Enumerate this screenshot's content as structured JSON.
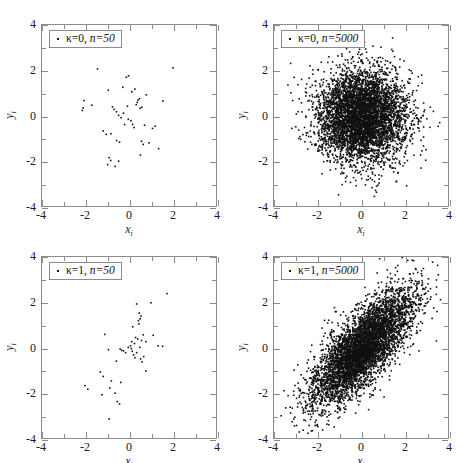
{
  "figure": {
    "background": "#ffffff",
    "point_color": "#111111",
    "axis_color": "#8c8c8c",
    "rows": 2,
    "cols": 2
  },
  "axes": {
    "xlabel": "x",
    "xlabel_sub": "i",
    "ylabel": "y",
    "ylabel_sub": "i",
    "xticks": [
      "-4",
      "-2",
      "0",
      "2",
      "4"
    ],
    "yticks": [
      "-4",
      "-2",
      "0",
      "2",
      "4"
    ],
    "xlim": [
      -4,
      4
    ],
    "ylim": [
      -4,
      4
    ],
    "xtick_values": [
      -4,
      -2,
      0,
      2,
      4
    ],
    "ytick_values": [
      -4,
      -2,
      0,
      2,
      4
    ],
    "minor_tick_values": [
      -3,
      -1,
      1,
      3
    ]
  },
  "panels": [
    {
      "id": "panel-tl",
      "legend_marker": "dot-marker",
      "legend_kappa": "κ=0,",
      "legend_n": "n=50",
      "kappa": 0,
      "n": 50
    },
    {
      "id": "panel-tr",
      "legend_marker": "dot-marker",
      "legend_kappa": "κ=0,",
      "legend_n": "n=5000",
      "kappa": 0,
      "n": 5000
    },
    {
      "id": "panel-bl",
      "legend_marker": "dot-marker",
      "legend_kappa": "κ=1,",
      "legend_n": "n=50",
      "kappa": 1,
      "n": 50
    },
    {
      "id": "panel-br",
      "legend_marker": "dot-marker",
      "legend_kappa": "κ=1,",
      "legend_n": "n=5000",
      "kappa": 1,
      "n": 5000
    }
  ],
  "chart_data": [
    {
      "type": "scatter",
      "panel": "top-left",
      "title": "κ=0, n=50",
      "xlabel": "x_i",
      "ylabel": "y_i",
      "xlim": [
        -4,
        4
      ],
      "ylim": [
        -4,
        4
      ],
      "grid": false,
      "legend_position": "upper-left",
      "n_points": 50,
      "kappa": 0,
      "correlation": 0.0,
      "marker": "dot",
      "marker_color": "#111111",
      "points": [
        [
          -1.48,
          2.08
        ],
        [
          1.95,
          2.13
        ],
        [
          -0.17,
          1.72
        ],
        [
          -0.07,
          1.78
        ],
        [
          -0.99,
          1.15
        ],
        [
          -0.33,
          1.28
        ],
        [
          0.22,
          1.2
        ],
        [
          0.08,
          1.08
        ],
        [
          -2.09,
          0.7
        ],
        [
          -1.74,
          0.5
        ],
        [
          0.43,
          0.78
        ],
        [
          0.36,
          0.72
        ],
        [
          0.74,
          0.95
        ],
        [
          1.49,
          0.68
        ],
        [
          -2.13,
          0.38
        ],
        [
          -2.17,
          0.27
        ],
        [
          -0.8,
          0.42
        ],
        [
          -0.73,
          0.31
        ],
        [
          -0.62,
          0.21
        ],
        [
          -0.12,
          0.45
        ],
        [
          0.28,
          0.52
        ],
        [
          0.46,
          0.36
        ],
        [
          0.54,
          0.41
        ],
        [
          -0.52,
          0.05
        ],
        [
          -0.41,
          -0.05
        ],
        [
          -0.08,
          -0.12
        ],
        [
          0.04,
          -0.18
        ],
        [
          0.12,
          -0.34
        ],
        [
          0.18,
          -0.48
        ],
        [
          -0.25,
          -0.35
        ],
        [
          -1.22,
          -0.63
        ],
        [
          -1.08,
          -0.78
        ],
        [
          -0.87,
          -0.75
        ],
        [
          0.66,
          -0.38
        ],
        [
          1.02,
          -0.52
        ],
        [
          1.14,
          -0.42
        ],
        [
          -0.61,
          -1.05
        ],
        [
          -0.48,
          -1.12
        ],
        [
          0.52,
          -1.08
        ],
        [
          0.6,
          -1.22
        ],
        [
          0.86,
          -1.15
        ],
        [
          1.3,
          -1.4
        ],
        [
          0.47,
          -1.68
        ],
        [
          -0.95,
          -1.8
        ],
        [
          -0.88,
          -1.92
        ],
        [
          -0.52,
          -1.95
        ],
        [
          -1.02,
          -2.1
        ],
        [
          -0.68,
          -2.18
        ],
        [
          0.33,
          0.62
        ],
        [
          -0.3,
          0.15
        ]
      ]
    },
    {
      "type": "scatter",
      "panel": "top-right",
      "title": "κ=0, n=5000",
      "xlabel": "x_i",
      "ylabel": "y_i",
      "xlim": [
        -4,
        4
      ],
      "ylim": [
        -4,
        4
      ],
      "grid": false,
      "legend_position": "upper-left",
      "n_points": 5000,
      "kappa": 0,
      "correlation": 0.0,
      "distribution": "bivariate-normal",
      "mean": [
        0,
        0
      ],
      "sigma_x": 1.0,
      "sigma_y": 1.0,
      "marker": "dot",
      "marker_color": "#111111"
    },
    {
      "type": "scatter",
      "panel": "bottom-left",
      "title": "κ=1, n=50",
      "xlabel": "x_i",
      "ylabel": "y_i",
      "xlim": [
        -4,
        4
      ],
      "ylim": [
        -4,
        4
      ],
      "grid": false,
      "legend_position": "upper-left",
      "n_points": 50,
      "kappa": 1,
      "correlation": 0.7,
      "marker": "dot",
      "marker_color": "#111111",
      "points": [
        [
          1.68,
          2.4
        ],
        [
          0.95,
          2.0
        ],
        [
          0.3,
          1.95
        ],
        [
          0.42,
          1.55
        ],
        [
          0.5,
          1.42
        ],
        [
          0.46,
          1.3
        ],
        [
          0.38,
          1.22
        ],
        [
          0.12,
          0.95
        ],
        [
          -1.15,
          0.62
        ],
        [
          0.6,
          0.6
        ],
        [
          1.05,
          0.58
        ],
        [
          0.25,
          0.48
        ],
        [
          0.35,
          0.42
        ],
        [
          0.52,
          0.35
        ],
        [
          0.72,
          0.3
        ],
        [
          0.2,
          0.22
        ],
        [
          -0.98,
          -0.05
        ],
        [
          -0.45,
          -0.02
        ],
        [
          -0.38,
          -0.08
        ],
        [
          -0.3,
          -0.1
        ],
        [
          -0.08,
          0.05
        ],
        [
          0.02,
          0.12
        ],
        [
          0.06,
          0.0
        ],
        [
          0.1,
          -0.12
        ],
        [
          1.28,
          0.12
        ],
        [
          1.48,
          0.1
        ],
        [
          0.16,
          -0.28
        ],
        [
          0.22,
          -0.4
        ],
        [
          0.48,
          -0.45
        ],
        [
          0.55,
          -0.58
        ],
        [
          0.62,
          -0.35
        ],
        [
          -0.62,
          -0.55
        ],
        [
          -1.35,
          -1.02
        ],
        [
          -1.22,
          -1.22
        ],
        [
          -0.85,
          -1.42
        ],
        [
          -0.42,
          -1.48
        ],
        [
          0.72,
          -0.98
        ],
        [
          -2.05,
          -1.62
        ],
        [
          -1.92,
          -1.78
        ],
        [
          -0.92,
          -1.72
        ],
        [
          -1.28,
          -2.02
        ],
        [
          -0.68,
          -1.95
        ],
        [
          -0.58,
          -2.32
        ],
        [
          -0.48,
          -2.42
        ],
        [
          -0.95,
          -3.08
        ],
        [
          0.4,
          1.08
        ],
        [
          0.08,
          0.3
        ],
        [
          -0.2,
          -0.18
        ],
        [
          0.3,
          -0.18
        ],
        [
          0.44,
          0.05
        ]
      ]
    },
    {
      "type": "scatter",
      "panel": "bottom-right",
      "title": "κ=1, n=5000",
      "xlabel": "x_i",
      "ylabel": "y_i",
      "xlim": [
        -4,
        4
      ],
      "ylim": [
        -4,
        4
      ],
      "grid": false,
      "legend_position": "upper-left",
      "n_points": 5000,
      "kappa": 1,
      "correlation": 0.75,
      "distribution": "bivariate-normal",
      "mean": [
        0,
        0
      ],
      "sigma_x": 1.15,
      "sigma_y": 1.25,
      "marker": "dot",
      "marker_color": "#111111"
    }
  ]
}
